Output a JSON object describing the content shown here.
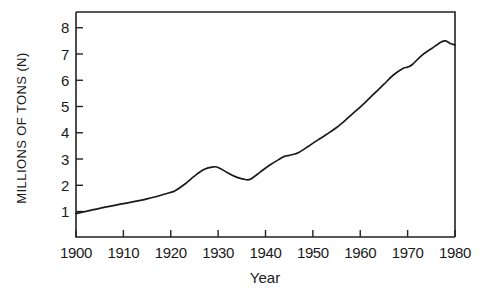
{
  "chart_data": {
    "type": "line",
    "title": "",
    "xlabel": "Year",
    "ylabel": "MILLIONS OF TONS (N)",
    "xlim": [
      1900,
      1980
    ],
    "ylim": [
      0.03,
      8.6
    ],
    "grid": false,
    "legend": null,
    "xticks": [
      1900,
      1910,
      1920,
      1930,
      1940,
      1950,
      1960,
      1970,
      1980
    ],
    "xtick_labels": [
      "1900",
      "1910",
      "1920",
      "1930",
      "1940",
      "1950",
      "1960",
      "1970",
      "1980"
    ],
    "yticks": [
      1,
      2,
      3,
      4,
      5,
      6,
      7,
      8
    ],
    "ytick_labels": [
      "1",
      "2",
      "3",
      "4",
      "5",
      "6",
      "7",
      "8"
    ],
    "series": [
      {
        "name": "Nitrogen production",
        "color": "#1a1a1a",
        "x": [
          1900,
          1905,
          1910,
          1915,
          1920,
          1921,
          1923,
          1925,
          1927,
          1929,
          1930,
          1932,
          1934,
          1936,
          1937,
          1939,
          1941,
          1943,
          1944,
          1945,
          1946,
          1947,
          1949,
          1951,
          1953,
          1955,
          1957,
          1959,
          1961,
          1963,
          1965,
          1967,
          1969,
          1970,
          1971,
          1973,
          1975,
          1977,
          1978,
          1979,
          1980
        ],
        "y": [
          0.92,
          1.12,
          1.3,
          1.48,
          1.73,
          1.8,
          2.05,
          2.35,
          2.6,
          2.7,
          2.68,
          2.48,
          2.3,
          2.21,
          2.25,
          2.52,
          2.78,
          3.0,
          3.1,
          3.14,
          3.18,
          3.25,
          3.48,
          3.72,
          3.95,
          4.2,
          4.5,
          4.82,
          5.15,
          5.5,
          5.85,
          6.2,
          6.45,
          6.5,
          6.6,
          6.95,
          7.2,
          7.45,
          7.5,
          7.4,
          7.35
        ]
      }
    ]
  },
  "axes": {
    "x_title": "Year",
    "y_title": "MILLIONS OF TONS (N)"
  }
}
